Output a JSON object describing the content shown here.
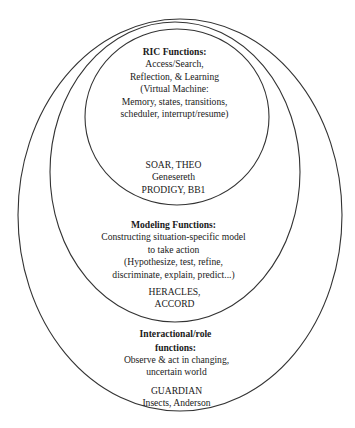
{
  "diagram": {
    "type": "nested-ellipses",
    "layers": [
      {
        "id": "ric",
        "heading": "RIC Functions:",
        "description": [
          "Access/Search,",
          "Reflection, & Learning",
          "(Virtual Machine:",
          "Memory, states, transitions,",
          "scheduler, interrupt/resume)"
        ],
        "examples": [
          "SOAR, THEO",
          "Genesereth",
          "PRODIGY, BB1"
        ]
      },
      {
        "id": "modeling",
        "heading": "Modeling Functions:",
        "description": [
          "Constructing situation-specific model",
          "to take action",
          "(Hypothesize, test, refine,",
          "discriminate, explain, predict...)"
        ],
        "examples": [
          "HERACLES,",
          "ACCORD"
        ]
      },
      {
        "id": "interactional",
        "heading": [
          "Interactional/role",
          "functions:"
        ],
        "description": [
          "Observe & act in changing,",
          "uncertain world"
        ],
        "examples": [
          "GUARDIAN",
          "Insects, Anderson"
        ]
      }
    ],
    "stroke_color": "#333333"
  }
}
